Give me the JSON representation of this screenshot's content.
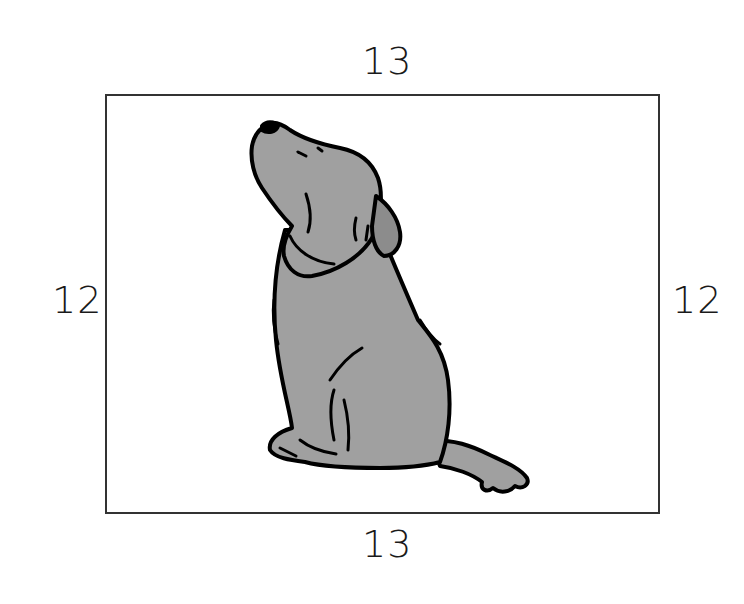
{
  "figure": {
    "type": "rectangle-with-picture",
    "picture": "dog-icon",
    "dimensions": {
      "top": "13",
      "bottom": "13",
      "left": "12",
      "right": "12"
    },
    "colors": {
      "border": "#333333",
      "dog_fill": "#a0a0a0",
      "dog_ear": "#8c8c8c",
      "outline": "#000000"
    }
  }
}
